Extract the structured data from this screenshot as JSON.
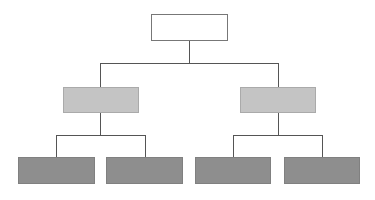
{
  "diagram": {
    "type": "org-chart",
    "levels": 3,
    "colors": {
      "root_fill": "#ffffff",
      "level1_fill": "#c4c4c4",
      "level2_fill": "#8e8e8e",
      "connector": "#555555"
    },
    "nodes": [
      {
        "id": "root",
        "label": ""
      },
      {
        "id": "child-left",
        "label": ""
      },
      {
        "id": "child-right",
        "label": ""
      },
      {
        "id": "leaf-1",
        "label": ""
      },
      {
        "id": "leaf-2",
        "label": ""
      },
      {
        "id": "leaf-3",
        "label": ""
      },
      {
        "id": "leaf-4",
        "label": ""
      }
    ]
  }
}
